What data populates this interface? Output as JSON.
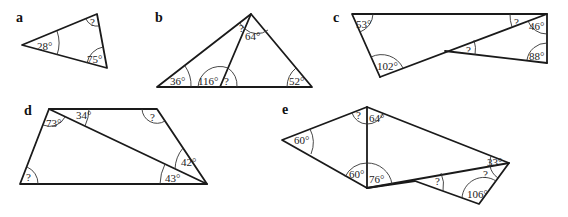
{
  "figures": {
    "a": {
      "label": "a",
      "angles": [
        "28°",
        "?",
        "75°"
      ]
    },
    "b": {
      "label": "b",
      "angles": [
        "36°",
        "?",
        "64°",
        "116°",
        "?",
        "52°"
      ]
    },
    "c": {
      "label": "c",
      "angles": [
        "53°",
        "?",
        "46°",
        "?",
        "88°",
        "102°"
      ]
    },
    "d": {
      "label": "d",
      "angles": [
        "73°",
        "34°",
        "?",
        "42°",
        "43°",
        "?"
      ]
    },
    "e": {
      "label": "e",
      "angles": [
        "60°",
        "?",
        "64°",
        "60°",
        "76°",
        "?",
        "33°",
        "?",
        "106°"
      ]
    }
  }
}
